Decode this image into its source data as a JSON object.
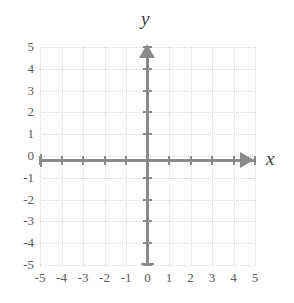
{
  "chart_data": {
    "type": "scatter",
    "title": "",
    "xlabel": "x",
    "ylabel": "y",
    "xlim": [
      -5,
      5
    ],
    "ylim": [
      -5,
      5
    ],
    "grid": true,
    "legend": false,
    "series": [],
    "x_ticks": [
      -5,
      -4,
      -3,
      -2,
      -1,
      0,
      1,
      2,
      3,
      4,
      5
    ],
    "y_ticks": [
      5,
      4,
      3,
      2,
      1,
      0,
      -1,
      -2,
      -3,
      -4,
      -5
    ],
    "x_tick_labels": [
      "-5",
      "-4",
      "-3",
      "-2",
      "-1",
      "0",
      "1",
      "2",
      "3",
      "4",
      "5"
    ],
    "y_tick_labels": [
      "5",
      "4",
      "3",
      "2",
      "1",
      "0",
      "-1",
      "-2",
      "-3",
      "-4",
      "-5"
    ],
    "axis_color": "#8a8a8a",
    "grid_color": "#d8d8d8",
    "label_color": "#58585a",
    "background_color": "#ffffff",
    "x_axis_arrow": "right",
    "y_axis_arrow": "up"
  },
  "axes": {
    "x_name": "x",
    "y_name": "y"
  }
}
